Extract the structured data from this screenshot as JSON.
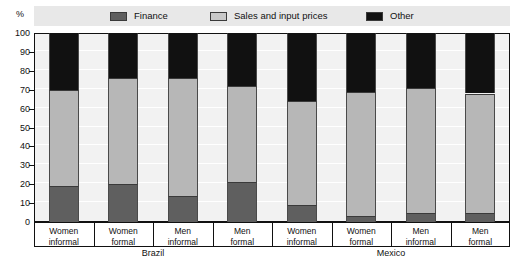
{
  "axis": {
    "unit_symbol": "%",
    "y_ticks": [
      0,
      10,
      20,
      30,
      40,
      50,
      60,
      70,
      80,
      90,
      100
    ]
  },
  "legend": {
    "items": [
      {
        "label": "Finance",
        "color": "#5f5f5f",
        "icon": "legend-swatch-finance"
      },
      {
        "label": "Sales and input prices",
        "color": "#b7b7b7",
        "icon": "legend-swatch-sales"
      },
      {
        "label": "Other",
        "color": "#111111",
        "icon": "legend-swatch-other"
      }
    ]
  },
  "groups": [
    {
      "label": "Brazil"
    },
    {
      "label": "Mexico"
    }
  ],
  "categories": [
    {
      "line1": "Women",
      "line2": "informal",
      "group": "Brazil"
    },
    {
      "line1": "Women",
      "line2": "formal",
      "group": "Brazil"
    },
    {
      "line1": "Men",
      "line2": "informal",
      "group": "Brazil"
    },
    {
      "line1": "Men",
      "line2": "formal",
      "group": "Brazil"
    },
    {
      "line1": "Women",
      "line2": "informal",
      "group": "Mexico"
    },
    {
      "line1": "Women",
      "line2": "formal",
      "group": "Mexico"
    },
    {
      "line1": "Men",
      "line2": "informal",
      "group": "Mexico"
    },
    {
      "line1": "Men",
      "line2": "formal",
      "group": "Mexico"
    }
  ],
  "chart_data": {
    "type": "bar",
    "title": "",
    "subtitle": "",
    "stacked": true,
    "stack_total": 100,
    "xlabel": "",
    "ylabel": "%",
    "ylim": [
      0,
      100
    ],
    "ytick_step": 10,
    "grid": true,
    "legend_position": "top",
    "categories": [
      "Brazil Women informal",
      "Brazil Women formal",
      "Brazil Men informal",
      "Brazil Men formal",
      "Mexico Women informal",
      "Mexico Women formal",
      "Mexico Men informal",
      "Mexico Men formal"
    ],
    "series": [
      {
        "name": "Finance",
        "color": "#5f5f5f",
        "values": [
          19,
          20,
          14,
          21,
          9,
          3,
          5,
          5
        ]
      },
      {
        "name": "Sales and input prices",
        "color": "#b7b7b7",
        "values": [
          51,
          56,
          62,
          51,
          55,
          66,
          66,
          63
        ]
      },
      {
        "name": "Other",
        "color": "#111111",
        "values": [
          30,
          24,
          24,
          28,
          36,
          31,
          29,
          32
        ]
      }
    ],
    "cumulative_tops": {
      "finance": [
        19,
        20,
        14,
        21,
        9,
        3,
        5,
        5
      ],
      "sales": [
        70,
        76,
        76,
        72,
        64,
        69,
        71,
        68
      ],
      "other": [
        100,
        100,
        100,
        100,
        100,
        100,
        100,
        100
      ]
    }
  }
}
